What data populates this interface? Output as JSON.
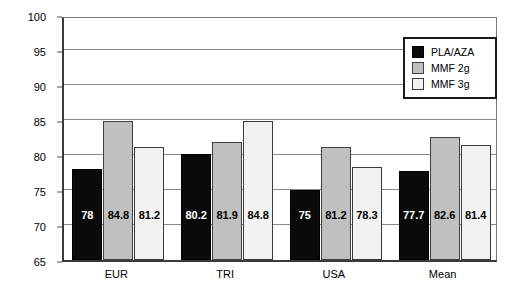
{
  "chart_data": {
    "type": "bar",
    "title": "",
    "xlabel": "",
    "ylabel": "% Survival",
    "ylim": [
      65,
      100
    ],
    "yticks": [
      65,
      70,
      75,
      80,
      85,
      90,
      95,
      100
    ],
    "grid": true,
    "grid_axis": "y",
    "legend_position": "top-right",
    "categories": [
      "EUR",
      "TRI",
      "USA",
      "Mean"
    ],
    "series": [
      {
        "name": "PLA/AZA",
        "color": "#0a0a0a",
        "values": [
          78,
          80.2,
          75,
          77.7
        ],
        "labels": [
          "78",
          "80.2",
          "75",
          "77.7"
        ]
      },
      {
        "name": "MMF 2g",
        "color": "#c0c0c0",
        "values": [
          84.8,
          81.9,
          81.2,
          82.6
        ],
        "labels": [
          "84.8",
          "81.9",
          "81.2",
          "82.6"
        ]
      },
      {
        "name": "MMF 3g",
        "color": "#f2f2f2",
        "values": [
          81.2,
          84.8,
          78.3,
          81.4
        ],
        "labels": [
          "81.2",
          "84.8",
          "78.3",
          "81.4"
        ]
      }
    ]
  },
  "axes": {
    "y_title": "% Survival",
    "y_tick_labels": [
      "100",
      "95",
      "90",
      "85",
      "80",
      "75",
      "70",
      "65"
    ],
    "x_tick_labels": [
      "EUR",
      "TRI",
      "USA",
      "Mean"
    ]
  },
  "legend": {
    "items": [
      {
        "label": "PLA/AZA"
      },
      {
        "label": "MMF 2g"
      },
      {
        "label": "MMF 3g"
      }
    ]
  }
}
